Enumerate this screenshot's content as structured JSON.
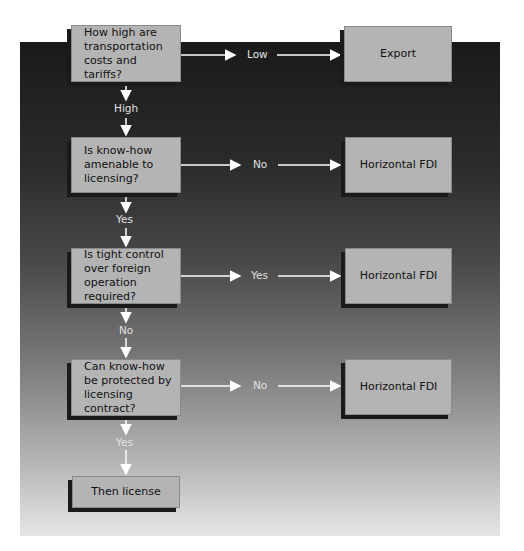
{
  "diagram": {
    "decisions": [
      {
        "id": "q1",
        "text": "How high are transportation costs and tariffs?",
        "yes_branch": "High",
        "side_branch": "Low",
        "side_outcome": "Export"
      },
      {
        "id": "q2",
        "text": "Is know-how amenable to licensing?",
        "down_branch": "Yes",
        "side_branch": "No",
        "side_outcome": "Horizontal FDI"
      },
      {
        "id": "q3",
        "text": "Is tight control over foreign operation required?",
        "down_branch": "No",
        "side_branch": "Yes",
        "side_outcome": "Horizontal FDI"
      },
      {
        "id": "q4",
        "text": "Can know-how be protected by licensing contract?",
        "down_branch": "Yes",
        "side_branch": "No",
        "side_outcome": "Horizontal FDI"
      }
    ],
    "final": {
      "text": "Then license"
    },
    "colors": {
      "box": "#b4b4b4",
      "shadow": "#1a1a1a",
      "arrow": "#ffffff",
      "panel_top": "#1a1a1a",
      "panel_bottom": "#e6e6e6"
    }
  }
}
